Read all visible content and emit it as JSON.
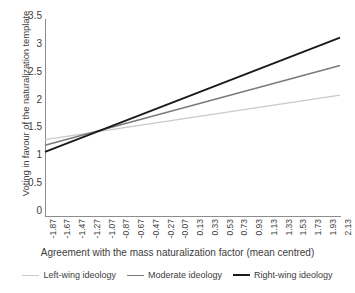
{
  "chart_data": {
    "type": "line",
    "title": "",
    "xlabel": "Agreement with the mass naturalization factor (mean centred)",
    "ylabel": "Voting in favour of the naturalization template",
    "xlim": [
      -1.87,
      2.13
    ],
    "ylim": [
      0,
      3.5
    ],
    "grid": false,
    "legend_position": "bottom",
    "xticks": [
      "-1.87",
      "-1.67",
      "-1.47",
      "-1.27",
      "-1.07",
      "-0.87",
      "-0.67",
      "-0.47",
      "-0.27",
      "-0.07",
      "0.13",
      "0.33",
      "0.53",
      "0.73",
      "0.93",
      "1.13",
      "1.33",
      "1.53",
      "1.73",
      "1.93",
      "2.13"
    ],
    "xtick_values": [
      -1.87,
      -1.67,
      -1.47,
      -1.27,
      -1.07,
      -0.87,
      -0.67,
      -0.47,
      -0.27,
      -0.07,
      0.13,
      0.33,
      0.53,
      0.73,
      0.93,
      1.13,
      1.33,
      1.53,
      1.73,
      1.93,
      2.13
    ],
    "yticks": [
      "0",
      "0.5",
      "1",
      "1.5",
      "2",
      "2.5",
      "3",
      "3.5"
    ],
    "ytick_values": [
      0,
      0.5,
      1,
      1.5,
      2,
      2.5,
      3,
      3.5
    ],
    "x": [
      -1.87,
      2.13
    ],
    "series": [
      {
        "name": "Left-wing ideology",
        "color": "#c9c9c9",
        "width": 1.4,
        "values": [
          1.37,
          2.17
        ]
      },
      {
        "name": "Moderate ideology",
        "color": "#7a7a7a",
        "width": 1.5,
        "values": [
          1.27,
          2.7
        ]
      },
      {
        "name": "Right-wing ideology",
        "color": "#1a1a1a",
        "width": 1.8,
        "values": [
          1.15,
          3.2
        ]
      }
    ]
  },
  "legend": {
    "items": [
      {
        "label": "Left-wing ideology",
        "color": "#c9c9c9",
        "width": 1.4
      },
      {
        "label": "Moderate ideology",
        "color": "#7a7a7a",
        "width": 1.6
      },
      {
        "label": "Right-wing ideology",
        "color": "#1a1a1a",
        "width": 2.2
      }
    ]
  },
  "axis": {
    "line_color": "#8c8c8c"
  }
}
